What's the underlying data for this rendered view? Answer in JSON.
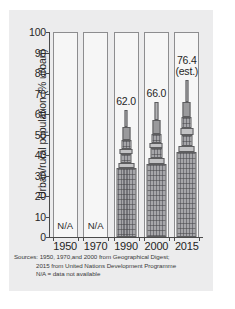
{
  "chart_data": {
    "type": "bar",
    "title": "",
    "xlabel": "",
    "ylabel": "Urban/rural population (% urban)",
    "ylim": [
      0,
      100
    ],
    "yticks": [
      0,
      10,
      20,
      30,
      40,
      50,
      60,
      70,
      80,
      90,
      100
    ],
    "grid": false,
    "legend": null,
    "categories": [
      "1950",
      "1970",
      "1990",
      "2000",
      "2015"
    ],
    "values": [
      null,
      null,
      62.0,
      66.0,
      76.4
    ],
    "data_labels": [
      "N/A",
      "N/A",
      "62.0",
      "66.0",
      "76.4"
    ],
    "annotations": [
      "(est.)"
    ],
    "bars": [
      {
        "year": "1950",
        "value": null,
        "label": "N/A",
        "has_data": false,
        "est": false
      },
      {
        "year": "1970",
        "value": null,
        "label": "N/A",
        "has_data": false,
        "est": false
      },
      {
        "year": "1990",
        "value": 62.0,
        "label": "62.0",
        "has_data": true,
        "est": false
      },
      {
        "year": "2000",
        "value": 66.0,
        "label": "66.0",
        "has_data": true,
        "est": false
      },
      {
        "year": "2015",
        "value": 76.4,
        "label": "76.4",
        "has_data": true,
        "est": true,
        "est_label": "(est.)"
      }
    ],
    "colors": {
      "panel_background": "#ececed",
      "column_background": "#f6f6f6",
      "column_border": "#8d8d8f",
      "building_fill": "#a9a9ab",
      "building_outline": "#5d5d5f",
      "axis": "#4a4a4a",
      "text": "#262626"
    }
  },
  "sources": {
    "line1": "Sources: 1950, 1970,and 2000 from Geographical Digest;",
    "line2": "2015 from United Nations Development Programme",
    "line3": "N/A = data not available"
  }
}
